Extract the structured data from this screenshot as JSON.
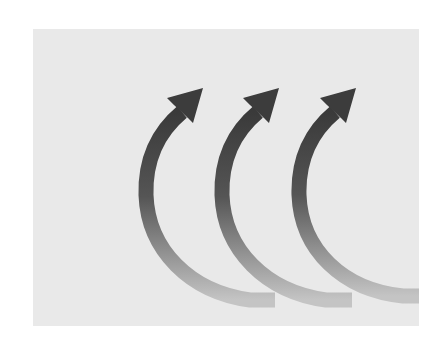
{
  "figure": {
    "background_color": "#ffffff",
    "panel_color": "#e9e9e9",
    "arrow_color_dark": "#3a3a3a",
    "arrow_color_light": "#bdbdbd",
    "arrows": [
      {
        "id": "arrow-1",
        "tip": [
          203,
          88
        ]
      },
      {
        "id": "arrow-2",
        "tip": [
          279,
          88
        ]
      },
      {
        "id": "arrow-3",
        "tip": [
          356,
          88
        ]
      }
    ]
  }
}
